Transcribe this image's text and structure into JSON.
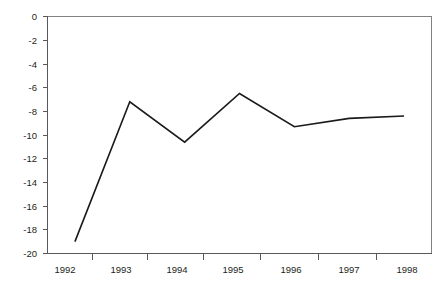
{
  "chart_data": {
    "type": "line",
    "title": "",
    "subtitle": "",
    "xlabel": "",
    "ylabel": "",
    "x": [
      "1992",
      "1993",
      "1994",
      "1995",
      "1996",
      "1997",
      "1998"
    ],
    "categories": [
      "1992",
      "1993",
      "1994",
      "1995",
      "1996",
      "1997",
      "1998"
    ],
    "values": [
      -19.0,
      -7.2,
      -10.6,
      -6.5,
      -9.3,
      -8.6,
      -8.4
    ],
    "series": [
      {
        "name": "",
        "values": [
          -19.0,
          -7.2,
          -10.6,
          -6.5,
          -9.3,
          -8.6,
          -8.4
        ]
      }
    ],
    "ylim": [
      -20,
      0
    ],
    "xlim": [
      0,
      7
    ],
    "ytick_labels": [
      "0",
      "-2",
      "-4",
      "-6",
      "-8",
      "-10",
      "-12",
      "-14",
      "-16",
      "-18",
      "-20"
    ],
    "ytick_values": [
      0,
      -2,
      -4,
      -6,
      -8,
      -10,
      -12,
      -14,
      -16,
      -18,
      -20
    ],
    "xtick_labels": [
      "1992",
      "1993",
      "1994",
      "1995",
      "1996",
      "1997",
      "1998"
    ],
    "grid": false,
    "legend": "none",
    "line_color": "#1a1a1a",
    "axis_color": "#58595b",
    "frame_color": "#808285",
    "background_color": "#ffffff",
    "text_color": "#231f20"
  },
  "labels": {
    "y": {
      "t0": "0",
      "t1": "-2",
      "t2": "-4",
      "t3": "-6",
      "t4": "-8",
      "t5": "-10",
      "t6": "-12",
      "t7": "-14",
      "t8": "-16",
      "t9": "-18",
      "t10": "-20"
    },
    "x": {
      "t0": "1992",
      "t1": "1993",
      "t2": "1994",
      "t3": "1995",
      "t4": "1996",
      "t5": "1997",
      "t6": "1998"
    }
  }
}
